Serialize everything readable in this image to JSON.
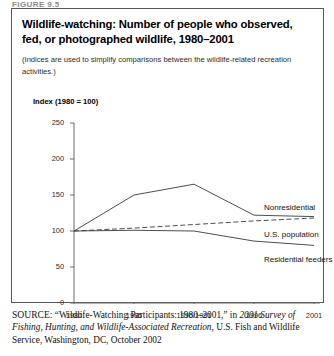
{
  "figure_label": "FIGURE 9.5",
  "title": "Wildlife-watching: Number of people who observed, fed, or photographed wildlife, 1980–2001",
  "subtitle": "(Indices are used to simplify comparisons between the wildlife-related recreation activities.)",
  "source": {
    "kicker": "SOURCE:",
    "quoted_title": "“Wildlife-Watching Participants: 1980–2001,”",
    "in_word": "in",
    "publication": "2001 Survey of Fishing, Hunting, and Wildlife-Associated Recreation,",
    "publisher": "U.S. Fish and Wildlife Service, Washington, DC, October 2002"
  },
  "chart_data": {
    "type": "line",
    "title": "Wildlife-watching: Number of people who observed, fed, or photographed wildlife, 1980–2001",
    "subtitle": "(Indices are used to simplify comparisons between the wildlife-related recreation activities.)",
    "ylabel": "Index (1980 = 100)",
    "xlabel": "",
    "categories": [
      "1980",
      "1985",
      "1990/1991",
      "1996",
      "2001"
    ],
    "ytick_labels": [
      "250",
      "200",
      "150",
      "100",
      "50",
      "0"
    ],
    "ytick_values": [
      250,
      200,
      150,
      100,
      50,
      0
    ],
    "ylim": [
      0,
      250
    ],
    "grid": false,
    "legend": "inline-labels-right",
    "series": [
      {
        "name": "Nonresidential",
        "style": "solid",
        "color": "#3a3a3a",
        "values": [
          100,
          150,
          165,
          122,
          120
        ]
      },
      {
        "name": "U.S. population",
        "style": "dashed",
        "color": "#3a3a3a",
        "values": [
          100,
          104,
          109,
          114,
          118
        ]
      },
      {
        "name": "Residential feeders",
        "style": "solid",
        "color": "#3a3a3a",
        "values": [
          100,
          101,
          100,
          86,
          80
        ]
      }
    ]
  }
}
